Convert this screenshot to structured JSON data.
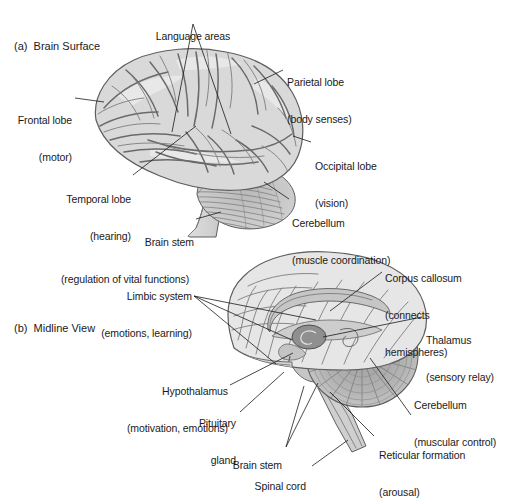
{
  "figure": {
    "title_a": "(a)  Brain Surface",
    "title_b": "(b)  Midline View",
    "background_color": "#ffffff",
    "text_color": "#1a1a1a",
    "brain_fill_color": "#d9d9d9",
    "brain_outline_color": "#5e5e5e",
    "leader_line_color": "#1a1a1a"
  },
  "panel_a": {
    "name": "brain-surface-lateral-view",
    "labels": [
      {
        "id": "language-areas",
        "line1": "Language areas",
        "line2": "",
        "align": "center"
      },
      {
        "id": "parietal-lobe",
        "line1": "Parietal lobe",
        "line2": "(body senses)",
        "align": "left"
      },
      {
        "id": "frontal-lobe",
        "line1": "Frontal lobe",
        "line2": "(motor)",
        "align": "right"
      },
      {
        "id": "occipital-lobe",
        "line1": "Occipital lobe",
        "line2": "(vision)",
        "align": "left"
      },
      {
        "id": "temporal-lobe",
        "line1": "Temporal lobe",
        "line2": "(hearing)",
        "align": "right"
      },
      {
        "id": "cerebellum",
        "line1": "Cerebellum",
        "line2": "(muscle coordination)",
        "align": "left"
      },
      {
        "id": "brain-stem",
        "line1": "Brain stem",
        "line2": "(regulation of vital functions)",
        "align": "right"
      }
    ]
  },
  "panel_b": {
    "name": "brain-midline-sagittal-view",
    "labels": [
      {
        "id": "limbic-system",
        "line1": "Limbic system",
        "line2": "(emotions, learning)",
        "align": "right"
      },
      {
        "id": "corpus-callosum",
        "line1": "Corpus callosum",
        "line2": "(connects",
        "line3": "hemispheres)",
        "align": "left"
      },
      {
        "id": "thalamus",
        "line1": "Thalamus",
        "line2": "(sensory relay)",
        "align": "left"
      },
      {
        "id": "hypothalamus",
        "line1": "Hypothalamus",
        "line2": "(motivation, emotions)",
        "align": "right"
      },
      {
        "id": "pituitary-gland",
        "line1": "Pituitary",
        "line2": "gland",
        "align": "right"
      },
      {
        "id": "cerebellum-midline",
        "line1": "Cerebellum",
        "line2": "(muscular control)",
        "align": "left"
      },
      {
        "id": "reticular-formation",
        "line1": "Reticular formation",
        "line2": "(arousal)",
        "align": "left"
      },
      {
        "id": "brain-stem-midline",
        "line1": "Brain stem",
        "line2": "",
        "align": "right"
      },
      {
        "id": "spinal-cord",
        "line1": "Spinal cord",
        "line2": "",
        "align": "right"
      }
    ]
  }
}
